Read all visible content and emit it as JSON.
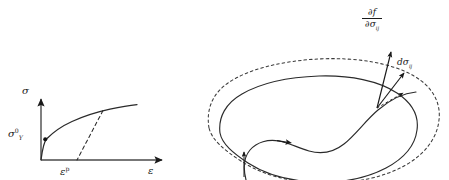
{
  "figure": {
    "background_color": "#ffffff",
    "stroke_color": "#1a1a1a",
    "width": 449,
    "height": 180
  },
  "left_panel": {
    "name": "uniaxial-hardening-diagram",
    "axes": {
      "y_label": "σ",
      "x_label": "ε",
      "y_axis_name": "stress-axis",
      "x_axis_name": "plastic-strain-axis"
    },
    "labels": {
      "yield_stress": {
        "base": "σ",
        "superscript": "0",
        "subscript": "Y"
      },
      "plastic_strain": {
        "base": "ε",
        "superscript": "p"
      },
      "strain": "ε"
    },
    "markers": [
      {
        "name": "yield-point-dot",
        "label": "initial yield point"
      }
    ],
    "curves": [
      {
        "name": "hardening-curve",
        "style": "solid",
        "description": "monotonic strain hardening stress-strain curve"
      },
      {
        "name": "unloading-line",
        "style": "dashed",
        "description": "elastic unloading slope to plastic strain intercept"
      }
    ]
  },
  "right_panel": {
    "name": "yield-surface-diagram",
    "surfaces": [
      {
        "name": "initial-yield-surface",
        "style": "solid",
        "description": "current yield surface"
      },
      {
        "name": "expanded-yield-surface",
        "style": "dashed",
        "description": "subsequent expanded yield surface"
      }
    ],
    "stress_path": {
      "name": "stress-path-curve",
      "style": "solid",
      "arrows": [
        "path-start-arrow",
        "path-direction-arrow"
      ]
    },
    "vectors": [
      {
        "name": "gradient-vector",
        "style": "solid",
        "label": {
          "numerator": "∂f",
          "denominator_base": "∂σ",
          "denominator_sub": "ij"
        }
      },
      {
        "name": "stress-increment-vector",
        "style": "solid",
        "label": {
          "base": "dσ",
          "subscript": "ij"
        }
      },
      {
        "name": "projection-vector",
        "style": "dashed",
        "label": ""
      }
    ]
  }
}
